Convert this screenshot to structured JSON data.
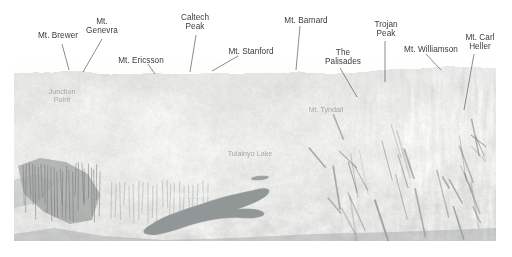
{
  "figure": {
    "kind": "annotated-panorama-photograph",
    "background_color": "#ffffff",
    "photo": {
      "left": 14,
      "top": 62,
      "width": 482,
      "height": 179,
      "tone": "grayscale",
      "sky_color": "#fdfdfd",
      "ridge_color": "#c9cac5",
      "mid_slope_color": "#dcdcd8",
      "shadow_color": "#6e7370",
      "lake_color": "#7b8382"
    }
  },
  "callouts": [
    {
      "name": "mt-brewer",
      "text": "Mt. Brewer",
      "lines": [
        "Mt. Brewer"
      ],
      "lx": 30,
      "ly": 31,
      "lw": 56,
      "anchor_x": 62,
      "anchor_y": 44,
      "tip_x": 69,
      "tip_y": 70
    },
    {
      "name": "mt-genevra",
      "text": "Mt. Genevra",
      "lines": [
        "Mt.",
        "Genevra"
      ],
      "lx": 82,
      "ly": 17,
      "lw": 40,
      "anchor_x": 102,
      "anchor_y": 39,
      "tip_x": 83,
      "tip_y": 72
    },
    {
      "name": "mt-ericsson",
      "text": "Mt. Ericsson",
      "lines": [
        "Mt. Ericsson"
      ],
      "lx": 112,
      "ly": 56,
      "lw": 58,
      "anchor_x": 148,
      "anchor_y": 64,
      "tip_x": 155,
      "tip_y": 74
    },
    {
      "name": "caltech-peak",
      "text": "Caltech Peak",
      "lines": [
        "Caltech",
        "Peak"
      ],
      "lx": 172,
      "ly": 13,
      "lw": 46,
      "anchor_x": 196,
      "anchor_y": 35,
      "tip_x": 190,
      "tip_y": 72
    },
    {
      "name": "mt-stanford",
      "text": "Mt. Stanford",
      "lines": [
        "Mt. Stanford"
      ],
      "lx": 222,
      "ly": 47,
      "lw": 58,
      "anchor_x": 238,
      "anchor_y": 56,
      "tip_x": 212,
      "tip_y": 71
    },
    {
      "name": "mt-barnard",
      "text": "Mt. Barnard",
      "lines": [
        "Mt. Barnard"
      ],
      "lx": 278,
      "ly": 16,
      "lw": 56,
      "anchor_x": 300,
      "anchor_y": 26,
      "tip_x": 296,
      "tip_y": 70
    },
    {
      "name": "the-palisades",
      "text": "The Palisades",
      "lines": [
        "The",
        "Palisades"
      ],
      "lx": 320,
      "ly": 48,
      "lw": 46,
      "anchor_x": 340,
      "anchor_y": 68,
      "tip_x": 357,
      "tip_y": 97
    },
    {
      "name": "trojan-peak",
      "text": "Trojan Peak",
      "lines": [
        "Trojan",
        "Peak"
      ],
      "lx": 365,
      "ly": 20,
      "lw": 42,
      "anchor_x": 385,
      "anchor_y": 41,
      "tip_x": 385,
      "tip_y": 82
    },
    {
      "name": "mt-williamson",
      "text": "Mt. Williamson",
      "lines": [
        "Mt. Williamson"
      ],
      "lx": 398,
      "ly": 45,
      "lw": 66,
      "anchor_x": 426,
      "anchor_y": 54,
      "tip_x": 441,
      "tip_y": 70
    },
    {
      "name": "mt-carl-heller",
      "text": "Mt. Carl Heller",
      "lines": [
        "Mt. Carl",
        "Heller"
      ],
      "lx": 456,
      "ly": 33,
      "lw": 48,
      "anchor_x": 474,
      "anchor_y": 54,
      "tip_x": 464,
      "tip_y": 110
    }
  ],
  "photo_labels": [
    {
      "name": "junction-point-label",
      "text": "Junction\nPoint",
      "lines": [
        "Junction",
        "Point"
      ],
      "x": 40,
      "y": 88,
      "w": 44,
      "style": "faint"
    },
    {
      "name": "mt-tyndall-label",
      "text": "Mt. Tyndall",
      "lines": [
        "Mt. Tyndall"
      ],
      "x": 300,
      "y": 106,
      "w": 52,
      "style": "faint"
    },
    {
      "name": "tulainyo-lake-label",
      "text": "Tulainyo Lake",
      "lines": [
        "Tulainyo Lake"
      ],
      "x": 222,
      "y": 150,
      "w": 56,
      "style": "faint"
    },
    {
      "name": "wales-lake-label",
      "text": "Wales Lake",
      "lines": [
        "Wales Lake"
      ],
      "x": 168,
      "y": 191,
      "w": 46,
      "style": "onlake"
    }
  ]
}
